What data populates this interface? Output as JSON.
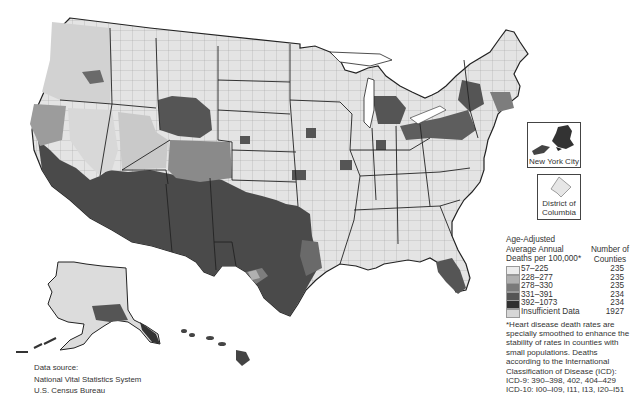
{
  "map": {
    "title": "Heart Disease Death Rates by County, United States",
    "region": "United States (contiguous, Alaska, Hawaii)",
    "classification_colors": {
      "57-225": "#e9e9e9",
      "228-277": "#b3b3b3",
      "278-330": "#7d7d7d",
      "331-391": "#555555",
      "392-1073": "#333333",
      "insufficient": "#d4d4d4"
    },
    "border_color": "#222222"
  },
  "insets": {
    "nyc_label": "New York City",
    "dc_label_line1": "District of",
    "dc_label_line2": "Columbia"
  },
  "legend": {
    "title_line1": "Age-Adjusted",
    "title_line2": "Average Annual",
    "title_line3": "Deaths per 100,000*",
    "count_header_line1": "Number of",
    "count_header_line2": "Counties",
    "classes": [
      {
        "range": "57–225",
        "count": "235",
        "color": "#ececec"
      },
      {
        "range": "228–277",
        "count": "235",
        "color": "#b0b0b0"
      },
      {
        "range": "278–330",
        "count": "235",
        "color": "#7a7a7a"
      },
      {
        "range": "331–391",
        "count": "234",
        "color": "#555555"
      },
      {
        "range": "392–1073",
        "count": "234",
        "color": "#303030"
      },
      {
        "range": "Insufficient Data",
        "count": "1927",
        "color": "#d6d6d6"
      }
    ],
    "footnote": "*Heart disease death rates are specially smoothed to enhance the stability of rates in counties with small populations. Deaths according to the International Classification of Disease (ICD):",
    "icd9": "ICD-9: 390–398, 402, 404–429",
    "icd10": "ICD-10: I00–I09, I11, I13, I20–I51"
  },
  "source": {
    "line1": "Data source:",
    "line2": "National Vital Statistics System",
    "line3": "U.S. Census Bureau"
  }
}
